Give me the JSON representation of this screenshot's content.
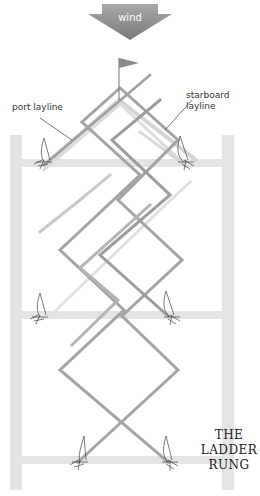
{
  "diagram": {
    "title_lines": [
      "THE",
      "LADDER",
      "RUNG"
    ],
    "wind_label": "wind",
    "port_layline_label": "port layline",
    "starboard_layline_label_lines": [
      "starboard",
      "layline"
    ],
    "icons": {
      "wind_arrow": "down-arrow-icon",
      "mark": "flag-icon",
      "boat": "sailboat-icon"
    },
    "colors": {
      "arrow": "#8c8c8c",
      "rail": "#e2e2e2",
      "course_dark": "#9a9a9a",
      "course_light": "#cfcfcf",
      "leader_line": "#555555"
    },
    "rungs_count": 3,
    "boats_count": 6
  }
}
